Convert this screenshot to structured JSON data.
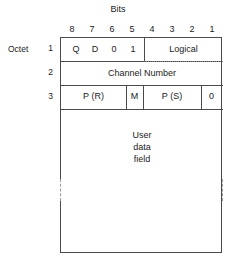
{
  "diagram": {
    "title": "Bits",
    "bit_numbers": [
      "8",
      "7",
      "6",
      "5",
      "4",
      "3",
      "2",
      "1"
    ],
    "octet_label": "Octet",
    "row_numbers": [
      "1",
      "2",
      "3"
    ],
    "octet1": {
      "q": "Q",
      "d": "D",
      "bit0": "0",
      "bit1": "1",
      "logical": "Logical"
    },
    "octet2": {
      "channel_number": "Channel Number"
    },
    "octet3": {
      "pr": "P (R)",
      "m": "M",
      "ps": "P (S)",
      "zero": "0"
    },
    "user_data": {
      "line1": "User",
      "line2": "data",
      "line3": "field"
    },
    "colors": {
      "background": "#ffffff",
      "line": "#4a4a4a",
      "dotted_line": "#7d7d7d",
      "dashed_break": "#9a9a9a",
      "text": "#1b1b1b"
    }
  }
}
